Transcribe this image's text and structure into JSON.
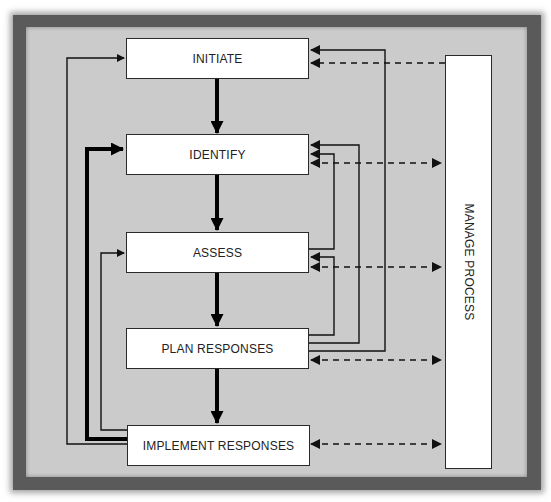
{
  "diagram": {
    "title": "",
    "process_steps": [
      {
        "id": "initiate",
        "label": "INITIATE"
      },
      {
        "id": "identify",
        "label": "IDENTIFY"
      },
      {
        "id": "assess",
        "label": "ASSESS"
      },
      {
        "id": "plan",
        "label": "PLAN RESPONSES"
      },
      {
        "id": "implement",
        "label": "IMPLEMENT RESPONSES"
      }
    ],
    "side_process": {
      "id": "manage",
      "label": "MANAGE PROCESS"
    },
    "edges": [
      {
        "from": "initiate",
        "to": "identify",
        "style": "thick-solid"
      },
      {
        "from": "identify",
        "to": "assess",
        "style": "thick-solid"
      },
      {
        "from": "assess",
        "to": "plan",
        "style": "thick-solid"
      },
      {
        "from": "plan",
        "to": "implement",
        "style": "thick-solid"
      },
      {
        "from": "implement",
        "to": "initiate",
        "style": "thin-solid",
        "side": "left"
      },
      {
        "from": "implement",
        "to": "identify",
        "style": "thick-solid",
        "side": "left"
      },
      {
        "from": "implement",
        "to": "assess",
        "style": "thin-solid",
        "side": "left"
      },
      {
        "from": "plan",
        "to": "initiate",
        "style": "thin-solid",
        "side": "right"
      },
      {
        "from": "plan",
        "to": "identify",
        "style": "thin-solid",
        "side": "right"
      },
      {
        "from": "assess",
        "to": "identify",
        "style": "thin-solid",
        "side": "right"
      },
      {
        "from": "plan",
        "to": "assess",
        "style": "thin-solid",
        "side": "right"
      },
      {
        "from": "manage",
        "to": "initiate",
        "style": "dashed"
      },
      {
        "from": "manage",
        "to": "identify",
        "style": "dashed-bidirectional"
      },
      {
        "from": "manage",
        "to": "assess",
        "style": "dashed-bidirectional"
      },
      {
        "from": "manage",
        "to": "plan",
        "style": "dashed-bidirectional"
      },
      {
        "from": "manage",
        "to": "implement",
        "style": "dashed-bidirectional"
      }
    ],
    "colors": {
      "background": "#cbcbcb",
      "frame": "#5a5a5a",
      "box_fill": "#ffffff",
      "line": "#111111"
    }
  }
}
